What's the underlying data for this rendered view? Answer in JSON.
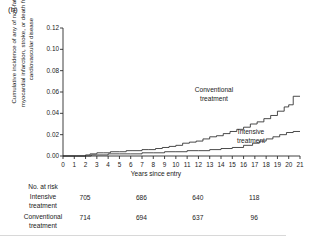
{
  "panel": {
    "label": "(b)"
  },
  "axes": {
    "y_title": "Cumulative incidence of any of non-fatal myocardial infarction, stroke, or death from cardiovascular disease",
    "x_title": "Years since entry",
    "y_ticks": [
      "0.12",
      "0.10",
      "0.08",
      "0.06",
      "0.04",
      "0.02",
      "0.00"
    ],
    "x_ticks": [
      "0",
      "1",
      "2",
      "3",
      "4",
      "5",
      "6",
      "7",
      "8",
      "9",
      "10",
      "11",
      "12",
      "13",
      "14",
      "15",
      "16",
      "17",
      "18",
      "19",
      "20",
      "21"
    ]
  },
  "annotations": {
    "conventional_line1": "Conventional",
    "conventional_line2": "treatment",
    "intensive_line1": "Intensive",
    "intensive_line2": "treatment"
  },
  "risk_table": {
    "header": "No. at risk",
    "rows": [
      {
        "label_line1": "Intensive",
        "label_line2": "treatment",
        "values": [
          "705",
          "686",
          "640",
          "118"
        ]
      },
      {
        "label_line1": "Conventional",
        "label_line2": "treatment",
        "values": [
          "714",
          "694",
          "637",
          "96"
        ]
      }
    ],
    "value_years": [
      0,
      5,
      10,
      15
    ]
  },
  "colors": {
    "axis": "#2b2b2b",
    "curve": "#2b2b2b",
    "text": "#1a1a1a"
  },
  "chart_data": {
    "type": "line",
    "title": "",
    "xlabel": "Years since entry",
    "ylabel": "Cumulative incidence of any of non-fatal myocardial infarction, stroke, or death from cardiovascular disease",
    "xlim": [
      0,
      21
    ],
    "ylim": [
      0.0,
      0.12
    ],
    "ytick_step": 0.02,
    "grid": false,
    "legend": "inline-annotations",
    "series": [
      {
        "name": "Conventional treatment",
        "x": [
          0,
          1.2,
          2.0,
          2.4,
          3.0,
          3.6,
          4.2,
          5.0,
          5.6,
          6.2,
          7.0,
          7.6,
          8.2,
          8.8,
          9.4,
          10.0,
          10.6,
          11.2,
          11.8,
          12.4,
          13.0,
          13.6,
          14.2,
          14.8,
          15.4,
          16.0,
          16.6,
          17.2,
          17.8,
          18.4,
          19.0,
          19.6,
          20.0,
          20.4,
          21.0
        ],
        "y": [
          0.0,
          0.0,
          0.001,
          0.002,
          0.003,
          0.003,
          0.004,
          0.004,
          0.005,
          0.005,
          0.006,
          0.006,
          0.007,
          0.008,
          0.009,
          0.01,
          0.012,
          0.013,
          0.014,
          0.016,
          0.018,
          0.019,
          0.021,
          0.023,
          0.025,
          0.027,
          0.03,
          0.032,
          0.035,
          0.038,
          0.042,
          0.046,
          0.048,
          0.056,
          0.056
        ]
      },
      {
        "name": "Intensive treatment",
        "x": [
          0,
          1.5,
          2.5,
          3.2,
          4.0,
          5.0,
          6.0,
          7.0,
          8.0,
          9.0,
          10.0,
          11.0,
          12.0,
          13.0,
          14.0,
          15.0,
          16.0,
          16.8,
          17.4,
          18.0,
          18.6,
          19.2,
          19.8,
          20.4,
          21.0
        ],
        "y": [
          0.0,
          0.0,
          0.001,
          0.001,
          0.002,
          0.002,
          0.002,
          0.003,
          0.003,
          0.004,
          0.004,
          0.005,
          0.005,
          0.006,
          0.007,
          0.008,
          0.01,
          0.012,
          0.014,
          0.016,
          0.018,
          0.02,
          0.022,
          0.023,
          0.023
        ]
      }
    ]
  }
}
